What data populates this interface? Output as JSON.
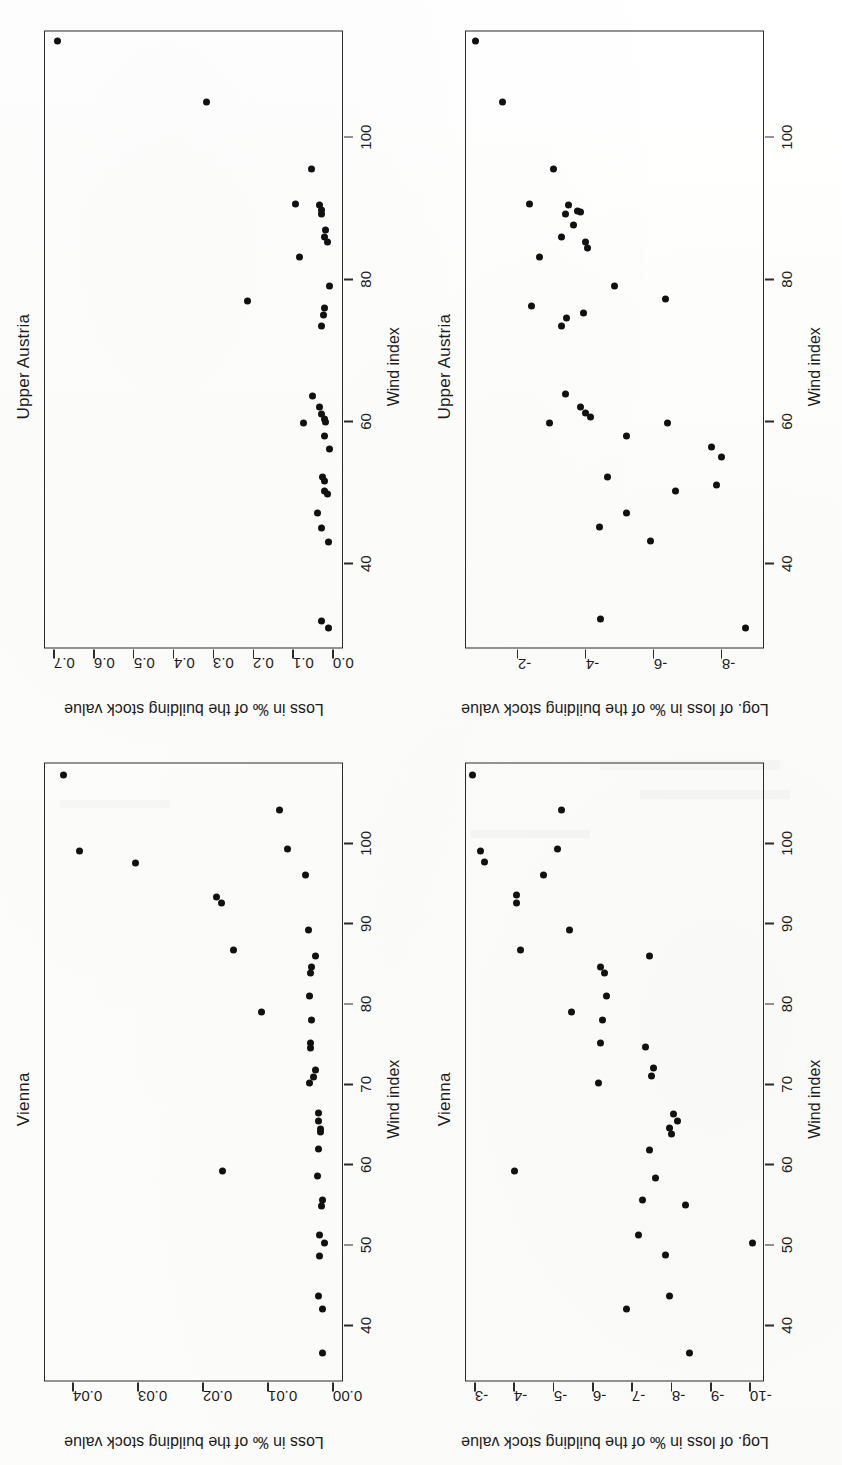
{
  "figure": {
    "orientation": "rotated-90-ccw",
    "xlabel": "Wind index",
    "x_ticks": [
      40,
      50,
      60,
      70,
      80,
      90,
      100
    ],
    "xlim": [
      33,
      110
    ],
    "ink_color": "#111111",
    "axis_color": "#2b2b2b"
  },
  "chart_data": [
    {
      "id": "vienna-loss",
      "type": "scatter",
      "title": "Vienna",
      "xlabel": "Wind index",
      "ylabel": "Loss in ‰ of the building stock value",
      "xlim": [
        33,
        110
      ],
      "ylim": [
        -0.0015,
        0.0445
      ],
      "x_ticks": [
        40,
        50,
        60,
        70,
        80,
        90,
        100
      ],
      "y_ticks": [
        0.0,
        0.01,
        0.02,
        0.03,
        0.04
      ],
      "y_tick_labels": [
        "0.00",
        "0.01",
        "0.02",
        "0.03",
        "0.04"
      ],
      "grid": false,
      "legend": "none",
      "points": [
        {
          "x": 108.5,
          "y": 0.0415
        },
        {
          "x": 104.2,
          "y": 0.0082
        },
        {
          "x": 99.0,
          "y": 0.039
        },
        {
          "x": 99.3,
          "y": 0.007
        },
        {
          "x": 97.6,
          "y": 0.0305
        },
        {
          "x": 96.0,
          "y": 0.0043
        },
        {
          "x": 93.3,
          "y": 0.018
        },
        {
          "x": 92.6,
          "y": 0.0172
        },
        {
          "x": 89.2,
          "y": 0.0038
        },
        {
          "x": 86.7,
          "y": 0.0154
        },
        {
          "x": 86.0,
          "y": 0.0028
        },
        {
          "x": 84.6,
          "y": 0.0033
        },
        {
          "x": 83.8,
          "y": 0.0035
        },
        {
          "x": 81.0,
          "y": 0.0036
        },
        {
          "x": 79.0,
          "y": 0.011
        },
        {
          "x": 78.0,
          "y": 0.0033
        },
        {
          "x": 75.2,
          "y": 0.0035
        },
        {
          "x": 74.5,
          "y": 0.0035
        },
        {
          "x": 71.8,
          "y": 0.0027
        },
        {
          "x": 70.9,
          "y": 0.003
        },
        {
          "x": 70.2,
          "y": 0.0036
        },
        {
          "x": 66.4,
          "y": 0.0023
        },
        {
          "x": 65.4,
          "y": 0.0022
        },
        {
          "x": 64.4,
          "y": 0.002
        },
        {
          "x": 64.0,
          "y": 0.0019
        },
        {
          "x": 62.0,
          "y": 0.0022
        },
        {
          "x": 59.2,
          "y": 0.017
        },
        {
          "x": 58.6,
          "y": 0.0024
        },
        {
          "x": 55.6,
          "y": 0.0017
        },
        {
          "x": 54.9,
          "y": 0.0018
        },
        {
          "x": 51.2,
          "y": 0.0021
        },
        {
          "x": 50.2,
          "y": 0.0014
        },
        {
          "x": 48.6,
          "y": 0.0021
        },
        {
          "x": 43.6,
          "y": 0.0022
        },
        {
          "x": 42.0,
          "y": 0.0017
        },
        {
          "x": 36.6,
          "y": 0.0016
        }
      ]
    },
    {
      "id": "upperaustria-loss",
      "type": "scatter",
      "title": "Upper Austria",
      "xlabel": "Wind index",
      "ylabel": "Loss in ‰ of the building stock value",
      "xlim": [
        28,
        115
      ],
      "ylim": [
        -0.025,
        0.725
      ],
      "x_ticks": [
        40,
        60,
        80,
        100
      ],
      "y_ticks": [
        0.0,
        0.1,
        0.2,
        0.3,
        0.4,
        0.5,
        0.6,
        0.7
      ],
      "y_tick_labels": [
        "0.0",
        "0.1",
        "0.2",
        "0.3",
        "0.4",
        "0.5",
        "0.6",
        "0.7"
      ],
      "grid": false,
      "legend": "none",
      "points": [
        {
          "x": 113.5,
          "y": 0.69
        },
        {
          "x": 105.0,
          "y": 0.318
        },
        {
          "x": 95.5,
          "y": 0.055
        },
        {
          "x": 90.6,
          "y": 0.095
        },
        {
          "x": 90.4,
          "y": 0.035
        },
        {
          "x": 89.7,
          "y": 0.028
        },
        {
          "x": 89.2,
          "y": 0.03
        },
        {
          "x": 87.0,
          "y": 0.02
        },
        {
          "x": 86.0,
          "y": 0.021
        },
        {
          "x": 85.2,
          "y": 0.015
        },
        {
          "x": 83.2,
          "y": 0.085
        },
        {
          "x": 79.0,
          "y": 0.008
        },
        {
          "x": 77.0,
          "y": 0.215
        },
        {
          "x": 76.0,
          "y": 0.022
        },
        {
          "x": 75.0,
          "y": 0.023
        },
        {
          "x": 73.4,
          "y": 0.03
        },
        {
          "x": 63.6,
          "y": 0.052
        },
        {
          "x": 62.0,
          "y": 0.035
        },
        {
          "x": 61.0,
          "y": 0.028
        },
        {
          "x": 60.4,
          "y": 0.022
        },
        {
          "x": 59.8,
          "y": 0.075
        },
        {
          "x": 60.0,
          "y": 0.018
        },
        {
          "x": 58.0,
          "y": 0.022
        },
        {
          "x": 56.2,
          "y": 0.01
        },
        {
          "x": 52.2,
          "y": 0.027
        },
        {
          "x": 51.6,
          "y": 0.022
        },
        {
          "x": 50.2,
          "y": 0.022
        },
        {
          "x": 49.8,
          "y": 0.015
        },
        {
          "x": 47.2,
          "y": 0.04
        },
        {
          "x": 45.0,
          "y": 0.03
        },
        {
          "x": 43.0,
          "y": 0.012
        },
        {
          "x": 32.0,
          "y": 0.03
        },
        {
          "x": 31.0,
          "y": 0.012
        }
      ]
    },
    {
      "id": "vienna-log-loss",
      "type": "scatter",
      "title": "Vienna",
      "xlabel": "Wind index",
      "ylabel": "Log. of loss in ‰ of the building stock value",
      "xlim": [
        33,
        110
      ],
      "ylim": [
        -10.35,
        -2.75
      ],
      "x_ticks": [
        40,
        50,
        60,
        70,
        80,
        90,
        100
      ],
      "y_ticks": [
        -3,
        -4,
        -5,
        -6,
        -7,
        -8,
        -9,
        -10
      ],
      "y_tick_labels": [
        "-3",
        "-4",
        "-5",
        "-6",
        "-7",
        "-8",
        "-9",
        "-10"
      ],
      "grid": false,
      "legend": "none",
      "points": [
        {
          "x": 108.5,
          "y": -2.95
        },
        {
          "x": 104.2,
          "y": -5.2
        },
        {
          "x": 99.0,
          "y": -3.15
        },
        {
          "x": 97.7,
          "y": -3.25
        },
        {
          "x": 99.3,
          "y": -5.1
        },
        {
          "x": 96.0,
          "y": -4.75
        },
        {
          "x": 93.6,
          "y": -4.05
        },
        {
          "x": 92.6,
          "y": -4.05
        },
        {
          "x": 89.2,
          "y": -5.4
        },
        {
          "x": 86.7,
          "y": -4.15
        },
        {
          "x": 86.0,
          "y": -7.45
        },
        {
          "x": 84.6,
          "y": -6.2
        },
        {
          "x": 83.8,
          "y": -6.3
        },
        {
          "x": 81.0,
          "y": -6.35
        },
        {
          "x": 79.0,
          "y": -5.45
        },
        {
          "x": 78.0,
          "y": -6.25
        },
        {
          "x": 75.2,
          "y": -6.2
        },
        {
          "x": 74.6,
          "y": -7.35
        },
        {
          "x": 72.0,
          "y": -7.55
        },
        {
          "x": 71.0,
          "y": -7.5
        },
        {
          "x": 70.2,
          "y": -6.15
        },
        {
          "x": 66.3,
          "y": -8.05
        },
        {
          "x": 65.4,
          "y": -8.15
        },
        {
          "x": 64.5,
          "y": -7.95
        },
        {
          "x": 63.8,
          "y": -8.0
        },
        {
          "x": 61.8,
          "y": -7.45
        },
        {
          "x": 59.2,
          "y": -4.0
        },
        {
          "x": 58.3,
          "y": -7.6
        },
        {
          "x": 55.6,
          "y": -7.25
        },
        {
          "x": 55.0,
          "y": -8.35
        },
        {
          "x": 51.3,
          "y": -7.15
        },
        {
          "x": 50.2,
          "y": -10.05
        },
        {
          "x": 48.7,
          "y": -7.85
        },
        {
          "x": 43.6,
          "y": -7.95
        },
        {
          "x": 42.0,
          "y": -6.85
        },
        {
          "x": 36.6,
          "y": -8.45
        }
      ]
    },
    {
      "id": "upperaustria-log-loss",
      "type": "scatter",
      "title": "Upper Austria",
      "xlabel": "Wind index",
      "ylabel": "Log. of loss in ‰ of the building stock value",
      "xlim": [
        28,
        115
      ],
      "ylim": [
        -9.25,
        -0.45
      ],
      "x_ticks": [
        40,
        60,
        80,
        100
      ],
      "y_ticks": [
        -2,
        -4,
        -6,
        -8
      ],
      "y_tick_labels": [
        "-2",
        "-4",
        "-6",
        "-8"
      ],
      "grid": false,
      "legend": "none",
      "points": [
        {
          "x": 113.5,
          "y": -0.75
        },
        {
          "x": 105.0,
          "y": -1.55
        },
        {
          "x": 95.5,
          "y": -3.05
        },
        {
          "x": 90.6,
          "y": -2.35
        },
        {
          "x": 90.5,
          "y": -3.5
        },
        {
          "x": 89.6,
          "y": -3.75
        },
        {
          "x": 89.4,
          "y": -3.85
        },
        {
          "x": 89.2,
          "y": -3.4
        },
        {
          "x": 87.6,
          "y": -3.65
        },
        {
          "x": 86.0,
          "y": -3.3
        },
        {
          "x": 85.2,
          "y": -4.0
        },
        {
          "x": 84.4,
          "y": -4.05
        },
        {
          "x": 83.2,
          "y": -2.65
        },
        {
          "x": 79.0,
          "y": -4.85
        },
        {
          "x": 77.2,
          "y": -6.35
        },
        {
          "x": 76.2,
          "y": -2.4
        },
        {
          "x": 75.2,
          "y": -3.95
        },
        {
          "x": 74.6,
          "y": -3.45
        },
        {
          "x": 73.4,
          "y": -3.3
        },
        {
          "x": 63.8,
          "y": -3.4
        },
        {
          "x": 62.0,
          "y": -3.85
        },
        {
          "x": 61.2,
          "y": -4.0
        },
        {
          "x": 60.6,
          "y": -4.15
        },
        {
          "x": 59.8,
          "y": -2.95
        },
        {
          "x": 59.8,
          "y": -6.4
        },
        {
          "x": 58.0,
          "y": -5.2
        },
        {
          "x": 56.4,
          "y": -7.7
        },
        {
          "x": 55.0,
          "y": -8.0
        },
        {
          "x": 52.2,
          "y": -4.65
        },
        {
          "x": 51.0,
          "y": -7.85
        },
        {
          "x": 50.2,
          "y": -6.65
        },
        {
          "x": 47.2,
          "y": -5.2
        },
        {
          "x": 45.2,
          "y": -4.4
        },
        {
          "x": 43.2,
          "y": -5.9
        },
        {
          "x": 32.2,
          "y": -4.45
        },
        {
          "x": 31.0,
          "y": -8.7
        }
      ]
    }
  ]
}
